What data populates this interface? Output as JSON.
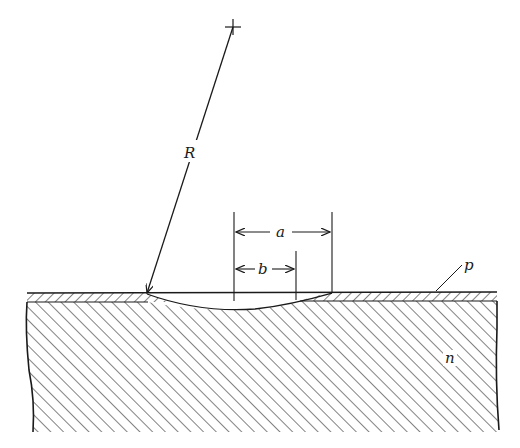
{
  "diagram": {
    "colors": {
      "ink": "#1a1a1a",
      "background": "#ffffff"
    },
    "labels": {
      "radius": "R",
      "outer_width": "a",
      "inner_width": "b",
      "p_layer": "p",
      "n_substrate": "n"
    },
    "regions": [
      {
        "name": "p-layer",
        "hatch": "fine diagonal (\\\\)",
        "label": "p"
      },
      {
        "name": "n-substrate",
        "hatch": "diagonal (//)",
        "label": "n"
      }
    ],
    "annotations": [
      {
        "type": "radius-arrow",
        "label": "R",
        "from": "center-crosshair",
        "to": "recess-edge"
      },
      {
        "type": "dimension",
        "label": "a",
        "meaning": "full recess width at surface"
      },
      {
        "type": "dimension",
        "label": "b",
        "meaning": "width where recess penetrates through p-layer"
      }
    ]
  }
}
